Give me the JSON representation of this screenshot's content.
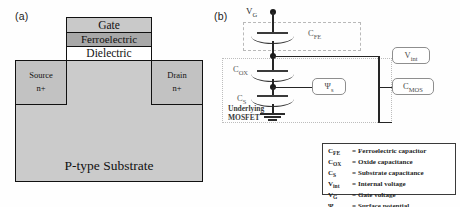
{
  "figure": {
    "panel_a": {
      "label": "(a)",
      "layers": {
        "gate": "Gate",
        "ferroelectric": "Ferroelectric",
        "dielectric": "Dielectric"
      },
      "source": {
        "line1": "Source",
        "line2": "n+"
      },
      "drain": {
        "line1": "Drain",
        "line2": "n+"
      },
      "substrate": "P-type Substrate",
      "colors": {
        "gate_fill": "#c9c9c9",
        "ferroelectric_fill": "#a8a8a8",
        "dielectric_fill": "#ffffff",
        "source_drain_fill": "#c2c2c2",
        "substrate_fill": "#cbcbcb",
        "outline": "#111111"
      }
    },
    "panel_b": {
      "label": "(b)",
      "nodes": {
        "gate_voltage": "V",
        "gate_voltage_sub": "G"
      },
      "capacitors": [
        {
          "name": "ferroelectric",
          "symbol": "C",
          "subscript": "FE"
        },
        {
          "name": "oxide",
          "symbol": "C",
          "subscript": "OX"
        },
        {
          "name": "substrate",
          "symbol": "C",
          "subscript": "S"
        }
      ],
      "callouts": [
        {
          "name": "surface-potential",
          "symbol": "Ψ",
          "subscript": "s"
        },
        {
          "name": "internal-voltage",
          "symbol": "V",
          "subscript": "int"
        },
        {
          "name": "mos-capacitance",
          "symbol": "C",
          "subscript": "MOS"
        }
      ],
      "group_caption": {
        "line1": "Underlying",
        "line2": "MOSFET"
      },
      "ground": "ground-symbol"
    },
    "legend": {
      "rows": [
        {
          "symbol": "C",
          "subscript": "FE",
          "equals": "=",
          "definition": "Ferroelectric capacitor"
        },
        {
          "symbol": "C",
          "subscript": "OX",
          "equals": "=",
          "definition": "Oxide capacitance"
        },
        {
          "symbol": "C",
          "subscript": "S",
          "equals": "=",
          "definition": "Substrate capacitance"
        },
        {
          "symbol": "V",
          "subscript": "int",
          "equals": "=",
          "definition": "Internal voltage"
        },
        {
          "symbol": "V",
          "subscript": "G",
          "equals": "=",
          "definition": "Gate voltage"
        },
        {
          "symbol": "Ψ",
          "subscript": "s",
          "equals": "=",
          "definition": "Surface potential"
        }
      ]
    }
  }
}
